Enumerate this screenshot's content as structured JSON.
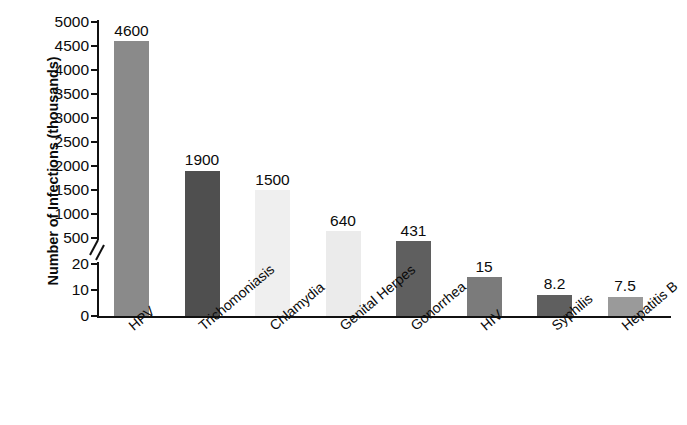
{
  "chart_data": {
    "type": "bar",
    "title": "",
    "xlabel": "",
    "ylabel": "Number of Infections (thousands)",
    "categories": [
      "HPV",
      "Trichomoniasis",
      "Chlamydia",
      "Genital Herpes",
      "Gonorrhea",
      "HIV",
      "Syphilis",
      "Hepatitis B"
    ],
    "values": [
      4600,
      1900,
      1500,
      640,
      431,
      15,
      8.2,
      7.5
    ],
    "value_labels": [
      "4600",
      "1900",
      "1500",
      "640",
      "431",
      "15",
      "8.2",
      "7.5"
    ],
    "bar_colors": [
      "#8a8a8a",
      "#4f4f4f",
      "#efefef",
      "#ebebeb",
      "#5f5f5f",
      "#7b7b7b",
      "#5f5f5f",
      "#9a9a9a"
    ],
    "grid": false,
    "legend": "none",
    "broken_axis": true,
    "axis_break_marker": "//",
    "y_lower_segment": [
      0,
      20
    ],
    "y_upper_segment": [
      500,
      5000
    ],
    "yticks": [
      0,
      10,
      20,
      500,
      1000,
      1500,
      2000,
      2500,
      3000,
      3500,
      4000,
      4500,
      5000
    ],
    "ytick_labels": [
      "0",
      "10",
      "20",
      "500",
      "1000",
      "1500",
      "2000",
      "2500",
      "3000",
      "3500",
      "4000",
      "4500",
      "5000"
    ]
  },
  "axis": {
    "y_title": "Number of Infections (thousands)"
  }
}
